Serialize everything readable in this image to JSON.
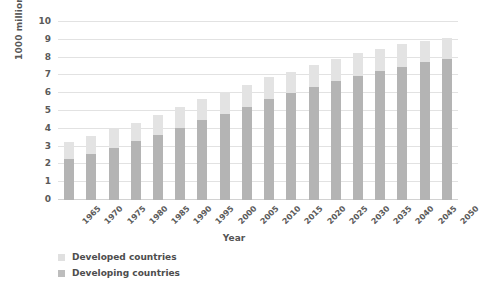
{
  "chart_data": {
    "type": "bar",
    "stacked": true,
    "title": "",
    "xlabel": "Year",
    "ylabel": "1000 million people",
    "ylim": [
      0,
      10
    ],
    "ytick_step": 1,
    "yticks": [
      "10",
      "9",
      "8",
      "7",
      "6",
      "5",
      "4",
      "3",
      "2",
      "1",
      "0"
    ],
    "grid": "horizontal",
    "legend_position": "bottom-left",
    "categories": [
      "1965",
      "1970",
      "1975",
      "1980",
      "1985",
      "1990",
      "1995",
      "2000",
      "2005",
      "2010",
      "2015",
      "2020",
      "2025",
      "2030",
      "2035",
      "2040",
      "2045",
      "2050"
    ],
    "series": [
      {
        "name": "Developing countries",
        "color": "#b4b4b4",
        "values": [
          2.3,
          2.6,
          2.95,
          3.3,
          3.65,
          4.05,
          4.5,
          4.85,
          5.25,
          5.65,
          6.0,
          6.35,
          6.7,
          6.95,
          7.25,
          7.5,
          7.75,
          7.95
        ]
      },
      {
        "name": "Developed countries",
        "color": "#e3e3e3",
        "values": [
          0.95,
          1.0,
          1.05,
          1.05,
          1.15,
          1.2,
          1.15,
          1.2,
          1.2,
          1.25,
          1.2,
          1.25,
          1.25,
          1.3,
          1.25,
          1.25,
          1.2,
          1.15
        ]
      }
    ],
    "totals": [
      3.25,
      3.6,
      4.0,
      4.35,
      4.8,
      5.25,
      5.65,
      6.05,
      6.45,
      6.9,
      7.2,
      7.6,
      7.95,
      8.25,
      8.5,
      8.75,
      8.95,
      9.1
    ]
  },
  "legend": {
    "items": [
      {
        "label": "Developed countries",
        "swatch": "developed"
      },
      {
        "label": "Developing countries",
        "swatch": "developing"
      }
    ]
  },
  "axes": {
    "x_title": "Year",
    "y_title": "1000 million people"
  },
  "colors": {
    "developed": "#e3e3e3",
    "developing": "#b4b4b4",
    "grid": "#e2e2e2",
    "text": "#5a5a5a",
    "background": "#ffffff"
  }
}
